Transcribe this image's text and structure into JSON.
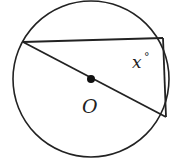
{
  "diagram": {
    "type": "geometry-circle-inscribed-triangle",
    "colors": {
      "stroke": "#222222",
      "background": "#ffffff"
    },
    "circle": {
      "cx": 91,
      "cy": 79,
      "r": 78
    },
    "center": {
      "x": 91,
      "y": 79,
      "label": "O"
    },
    "points": {
      "A": {
        "x": 23,
        "y": 42
      },
      "B": {
        "x": 163,
        "y": 38
      },
      "C": {
        "x": 166,
        "y": 117
      }
    },
    "angle_label": "x°",
    "angle_label_text": "x",
    "angle_degree": "°"
  }
}
